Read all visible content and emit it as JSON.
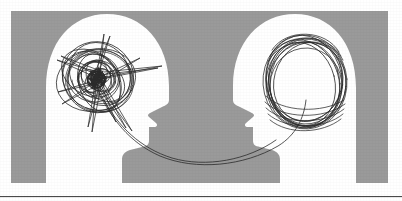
{
  "image": {
    "title": "Two facing head silhouettes with thought scribbles",
    "canvas": {
      "width": 402,
      "height": 201
    },
    "background_color": "#ffffff",
    "panel": {
      "name": "gray-panel",
      "fill_color": "#9a9a9a",
      "x": 11,
      "y": 11,
      "width": 377,
      "height": 172
    },
    "bottom_rule": {
      "name": "horizontal-rule",
      "color": "#4a4a4a",
      "x": 0,
      "y": 196,
      "width": 402,
      "height": 1
    },
    "heads": [
      {
        "id": "left-head",
        "label": "Left head silhouette facing right",
        "fill_color": "#ffffff",
        "facing": "right",
        "thought_state": "tangled",
        "scribble": {
          "id": "left-scribble",
          "label": "Chaotic tangled scribble",
          "stroke_color": "#2b2b2b",
          "stroke_width": 0.7,
          "style": "dense-chaotic-knot",
          "center_x": 96,
          "center_y": 80
        }
      },
      {
        "id": "right-head",
        "label": "Right head silhouette facing left",
        "fill_color": "#ffffff",
        "facing": "left",
        "thought_state": "orderly",
        "scribble": {
          "id": "right-scribble",
          "label": "Orderly concentric loops",
          "stroke_color": "#2b2b2b",
          "stroke_width": 0.7,
          "style": "nested-ellipse-loops",
          "center_x": 305,
          "center_y": 82
        }
      }
    ],
    "connector": {
      "id": "connector-line",
      "label": "Curved line linking the two scribbles",
      "stroke_color": "#2b2b2b",
      "stroke_width": 0.8,
      "from": "left-scribble",
      "to": "right-scribble"
    }
  }
}
